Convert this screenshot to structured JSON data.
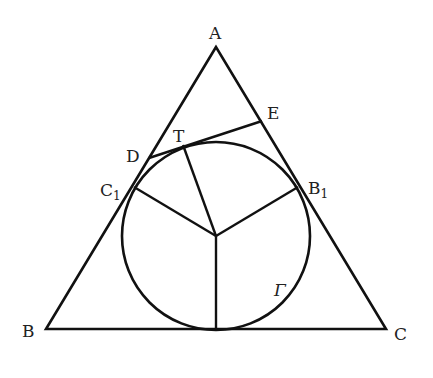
{
  "figure": {
    "type": "geometry-diagram",
    "labels": {
      "A": "A",
      "B": "B",
      "C": "C",
      "D": "D",
      "E": "E",
      "T": "T",
      "C1": "C",
      "C1_sub": "1",
      "B1": "B",
      "B1_sub": "1",
      "circle": "Γ"
    },
    "colors": {
      "stroke": "#111111",
      "background": "#ffffff"
    }
  }
}
